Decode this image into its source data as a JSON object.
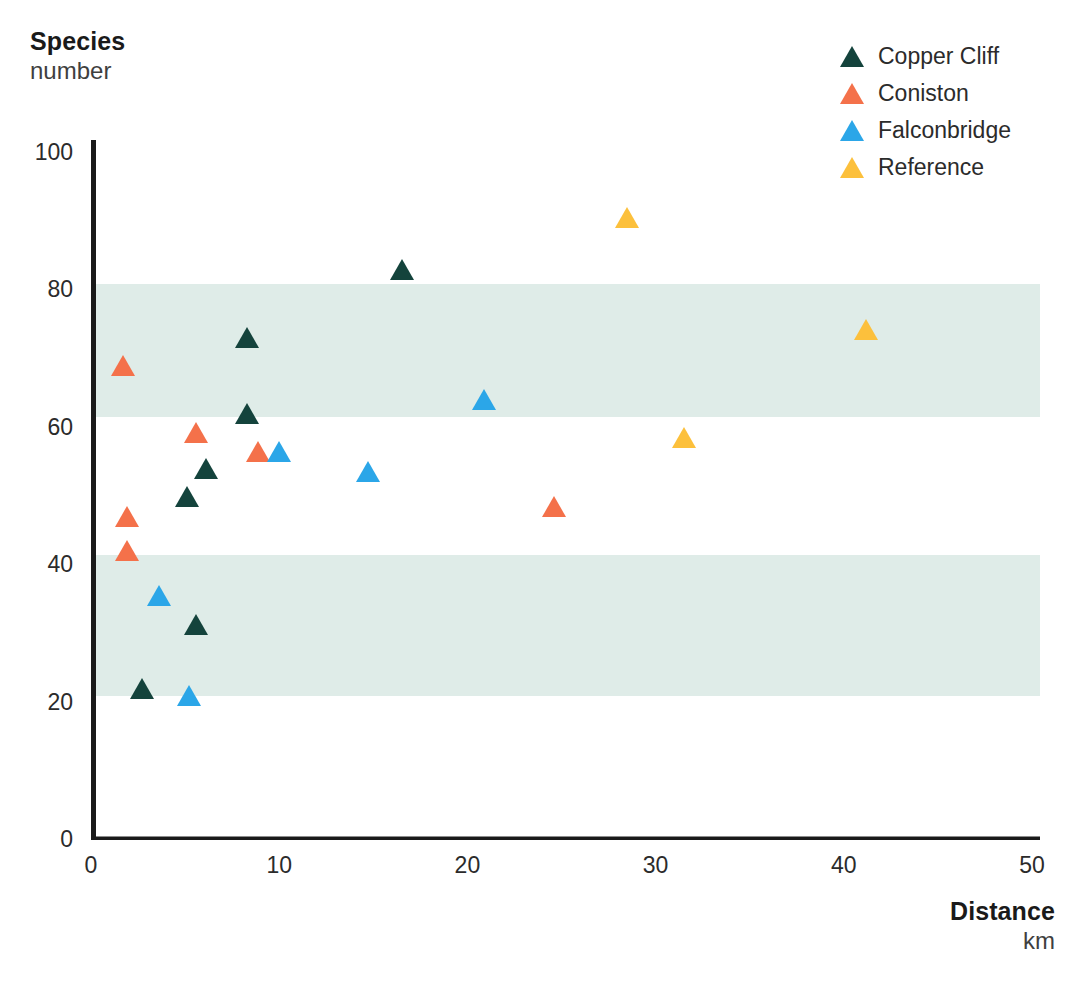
{
  "yaxis": {
    "title": "Species",
    "subtitle": "number",
    "ticks": [
      "0",
      "20",
      "40",
      "60",
      "80",
      "100"
    ],
    "min": 0,
    "max": 100
  },
  "xaxis": {
    "title": "Distance",
    "subtitle": "km",
    "ticks": [
      "0",
      "10",
      "20",
      "30",
      "40",
      "50"
    ],
    "min": 0,
    "max": 50
  },
  "legend": {
    "items": [
      {
        "label": "Copper Cliff",
        "color": "#14433c",
        "marker": "triangle-up-icon"
      },
      {
        "label": "Coniston",
        "color": "#f4714a",
        "marker": "triangle-up-icon"
      },
      {
        "label": "Falconbridge",
        "color": "#2ba6e8",
        "marker": "triangle-up-icon"
      },
      {
        "label": "Reference",
        "color": "#fcc03c",
        "marker": "triangle-up-icon"
      }
    ]
  },
  "bands": {
    "color": "#dfece8",
    "ranges": [
      {
        "ymin": 21,
        "ymax": 41.5
      },
      {
        "ymin": 61.5,
        "ymax": 81
      }
    ]
  },
  "chart_data": {
    "type": "scatter",
    "title": "",
    "xlabel": "Distance (km)",
    "ylabel": "Species number",
    "xlim": [
      0,
      50
    ],
    "ylim": [
      0,
      100
    ],
    "grid": false,
    "legend_position": "top-right",
    "marker": "triangle-up",
    "shaded_bands": [
      [
        21,
        41.5
      ],
      [
        61.5,
        81
      ]
    ],
    "series": [
      {
        "name": "Copper Cliff",
        "color": "#14433c",
        "points": [
          {
            "x": 2.7,
            "y": 22.0
          },
          {
            "x": 5.6,
            "y": 31.3
          },
          {
            "x": 5.1,
            "y": 50.0
          },
          {
            "x": 6.1,
            "y": 54.0
          },
          {
            "x": 8.3,
            "y": 62.0
          },
          {
            "x": 8.3,
            "y": 73.0
          },
          {
            "x": 16.5,
            "y": 83.0
          }
        ]
      },
      {
        "name": "Coniston",
        "color": "#f4714a",
        "points": [
          {
            "x": 1.9,
            "y": 42.0
          },
          {
            "x": 1.9,
            "y": 47.0
          },
          {
            "x": 5.6,
            "y": 59.3
          },
          {
            "x": 8.9,
            "y": 56.5
          },
          {
            "x": 1.7,
            "y": 69.0
          },
          {
            "x": 24.6,
            "y": 48.5
          }
        ]
      },
      {
        "name": "Falconbridge",
        "color": "#2ba6e8",
        "points": [
          {
            "x": 5.2,
            "y": 21.0
          },
          {
            "x": 3.6,
            "y": 35.5
          },
          {
            "x": 14.7,
            "y": 53.5
          },
          {
            "x": 10.0,
            "y": 56.5
          },
          {
            "x": 20.9,
            "y": 64.0
          }
        ]
      },
      {
        "name": "Reference",
        "color": "#fcc03c",
        "points": [
          {
            "x": 31.5,
            "y": 58.5
          },
          {
            "x": 41.2,
            "y": 74.3
          },
          {
            "x": 28.5,
            "y": 90.5
          }
        ]
      }
    ]
  }
}
